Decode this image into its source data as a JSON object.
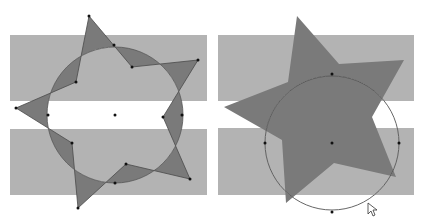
{
  "colors": {
    "background": "#ffffff",
    "band": "#b3b3b3",
    "star": "#7a7a7a",
    "star_stroke": "#4a4a4a",
    "circle_stroke": "#555555",
    "point": "#111111"
  },
  "figures": [
    {
      "name": "left-figure",
      "bands": [
        {
          "x": 10,
          "y": 35,
          "w": 197,
          "h": 66
        },
        {
          "x": 10,
          "y": 129,
          "w": 197,
          "h": 66
        }
      ],
      "circle": {
        "cx": 115,
        "cy": 115,
        "r": 68
      },
      "star": [
        [
          89,
          16
        ],
        [
          132,
          67
        ],
        [
          198,
          60
        ],
        [
          163,
          117
        ],
        [
          190,
          179
        ],
        [
          126,
          164
        ],
        [
          78,
          208
        ],
        [
          72,
          143
        ],
        [
          16,
          108
        ],
        [
          76,
          82
        ]
      ],
      "points": [
        [
          89,
          16
        ],
        [
          132,
          67
        ],
        [
          198,
          60
        ],
        [
          163,
          117
        ],
        [
          190,
          179
        ],
        [
          126,
          164
        ],
        [
          78,
          208
        ],
        [
          72,
          143
        ],
        [
          16,
          108
        ],
        [
          76,
          82
        ],
        [
          115,
          115
        ],
        [
          114,
          45
        ],
        [
          48,
          115
        ],
        [
          182,
          115
        ],
        [
          115,
          183
        ]
      ],
      "star_outline": true
    },
    {
      "name": "right-figure",
      "bands": [
        {
          "x": 218,
          "y": 35,
          "w": 196,
          "h": 66
        },
        {
          "x": 218,
          "y": 128,
          "w": 196,
          "h": 67
        }
      ],
      "circle": {
        "cx": 332,
        "cy": 143,
        "r": 67
      },
      "star": [
        [
          297,
          16
        ],
        [
          339,
          64
        ],
        [
          404,
          60
        ],
        [
          372,
          117
        ],
        [
          396,
          177
        ],
        [
          334,
          163
        ],
        [
          286,
          203
        ],
        [
          282,
          140
        ],
        [
          224,
          107
        ],
        [
          288,
          82
        ]
      ],
      "points": [
        [
          332,
          143
        ],
        [
          332,
          74
        ],
        [
          265,
          143
        ],
        [
          399,
          143
        ],
        [
          332,
          212
        ]
      ],
      "star_outline": false
    }
  ],
  "cursor": {
    "x": 368,
    "y": 203
  }
}
